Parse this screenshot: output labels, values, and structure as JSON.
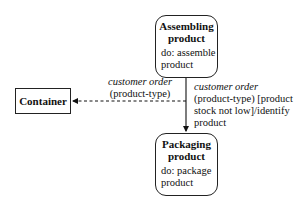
{
  "states": {
    "assembling": {
      "title_line1": "Assembling",
      "title_line2": "product",
      "activity_line1": "do: assemble",
      "activity_line2": "product"
    },
    "packaging": {
      "title_line1": "Packaging",
      "title_line2": "product",
      "activity_line1": "do: package",
      "activity_line2": "product"
    }
  },
  "object": {
    "label": "Container"
  },
  "transitions": {
    "to_container": {
      "event": "customer order",
      "params": "(product-type)"
    },
    "to_packaging": {
      "event": "customer order",
      "line2": "(product-type) [product",
      "line3": "stock not low]/identify",
      "line4": "product"
    }
  }
}
